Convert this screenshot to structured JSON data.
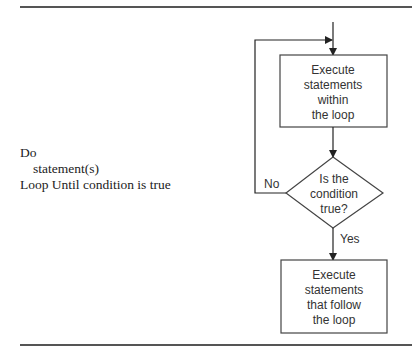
{
  "code": {
    "line1": "Do",
    "line2": "statement(s)",
    "line3": "Loop Until condition is true"
  },
  "flowchart": {
    "box_top": [
      "Execute",
      "statements",
      "within",
      "the loop"
    ],
    "decision": [
      "Is the",
      "condition",
      "true?"
    ],
    "no_label": "No",
    "yes_label": "Yes",
    "box_bottom": [
      "Execute",
      "statements",
      "that follow",
      "the loop"
    ]
  }
}
